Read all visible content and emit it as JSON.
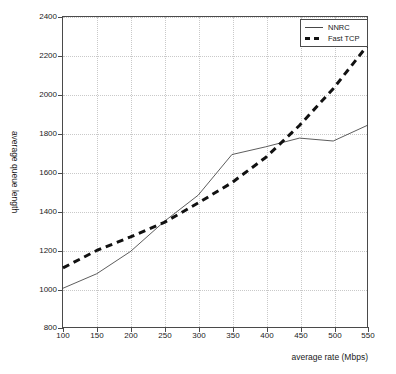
{
  "chart_data": {
    "type": "line",
    "title": "",
    "xlabel": "average rate (Mbps)",
    "ylabel": "average queue length",
    "xlim": [
      100,
      550
    ],
    "ylim": [
      800,
      2400
    ],
    "xticks": [
      100,
      150,
      200,
      250,
      300,
      350,
      400,
      450,
      500,
      550
    ],
    "yticks": [
      800,
      1000,
      1200,
      1400,
      1600,
      1800,
      2000,
      2200,
      2400
    ],
    "xticklabels": [
      "100",
      "150",
      "200",
      "250",
      "300",
      "350",
      "400",
      "450",
      "500",
      "550"
    ],
    "yticklabels": [
      "800",
      "1000",
      "1200",
      "1400",
      "1600",
      "1800",
      "2000",
      "2200",
      "2400"
    ],
    "grid": true,
    "grid_style": "dotted",
    "legend_position": "top-right",
    "x": [
      100,
      150,
      200,
      250,
      300,
      350,
      400,
      450,
      500,
      550
    ],
    "series": [
      {
        "name": "NNRC",
        "style": "solid",
        "color": "#333333",
        "linewidth": 0.8,
        "values": [
          1000,
          1075,
          1190,
          1345,
          1480,
          1690,
          1730,
          1775,
          1760,
          1840
        ]
      },
      {
        "name": "Fast TCP",
        "style": "dashed",
        "color": "#111111",
        "linewidth": 3,
        "values": [
          1105,
          1195,
          1265,
          1340,
          1440,
          1545,
          1675,
          1840,
          2030,
          2250
        ]
      }
    ]
  },
  "legend": {
    "entries": [
      {
        "label": "NNRC",
        "swatch": "solid-line-swatch"
      },
      {
        "label": "Fast TCP",
        "swatch": "dashed-line-swatch"
      }
    ]
  },
  "axes": {
    "x_title": "average rate (Mbps)",
    "y_title": "average queue length"
  }
}
